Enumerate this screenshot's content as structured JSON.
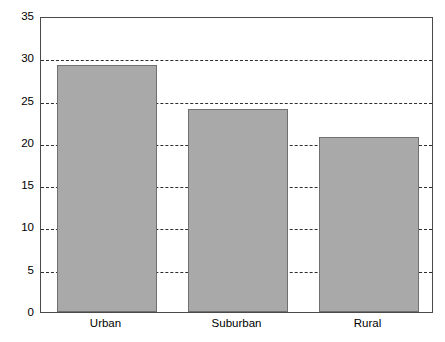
{
  "chart_data": {
    "type": "bar",
    "title": "",
    "subtitle": "",
    "xlabel": "",
    "ylabel": "",
    "categories": [
      "Urban",
      "Suburban",
      "Rural"
    ],
    "values": [
      29.2,
      24.0,
      20.7
    ],
    "series": [
      {
        "name": "",
        "values": [
          29.2,
          24.0,
          20.7
        ]
      }
    ],
    "ylim": [
      0,
      35
    ],
    "yticks": [
      0,
      5,
      10,
      15,
      20,
      25,
      30,
      35
    ],
    "ytick_labels": [
      "0",
      "5",
      "10",
      "15",
      "20",
      "25",
      "30",
      "35"
    ],
    "xtick_labels": [
      "Urban",
      "Suburban",
      "Rural"
    ],
    "grid": "horizontal-dashed",
    "legend": "none",
    "annotations": [],
    "colors": {
      "bar_fill": "#a9a9a9",
      "bar_border": "#707070",
      "gridline": "#2e2e2e",
      "axis": "#4a4a4a",
      "background": "#ffffff",
      "text": "#000000"
    }
  }
}
